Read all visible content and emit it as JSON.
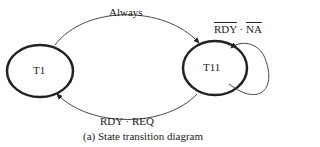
{
  "diagram": {
    "states": [
      {
        "id": "T1",
        "label": "T1"
      },
      {
        "id": "T11",
        "label": "T11"
      }
    ],
    "transitions": [
      {
        "from": "T1",
        "to": "T11",
        "label": "Always"
      },
      {
        "from": "T11",
        "to": "T1",
        "label": "RDY · REQ"
      },
      {
        "from": "T11",
        "to": "T11",
        "label_parts": [
          "RDY",
          " · ",
          "NA"
        ],
        "overlined": [
          "RDY",
          "NA"
        ]
      }
    ],
    "caption": "(a) State transition diagram"
  },
  "labels": {
    "always": "Always",
    "rdy_req": "RDY · REQ",
    "self_rdy": "RDY",
    "self_dot": " · ",
    "self_na": "NA",
    "t1": "T1",
    "t11": "T11",
    "caption": "(a) State transition diagram"
  }
}
